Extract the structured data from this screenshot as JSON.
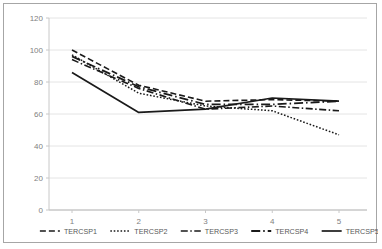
{
  "chart_data": {
    "type": "line",
    "title": "",
    "xlabel": "",
    "ylabel": "",
    "x": [
      1,
      2,
      3,
      4,
      5
    ],
    "categories": [
      "1",
      "2",
      "3",
      "4",
      "5"
    ],
    "ylim": [
      0,
      120
    ],
    "yticks": [
      0,
      20,
      40,
      60,
      80,
      100,
      120
    ],
    "ytick_labels": [
      "0",
      "20",
      "40",
      "60",
      "80",
      "100",
      "120"
    ],
    "xtick_labels": [
      "1",
      "2",
      "3",
      "4",
      "5"
    ],
    "grid": "horizontal",
    "legend_position": "bottom",
    "series": [
      {
        "name": "TERCSP1",
        "values": [
          100,
          78,
          68,
          69,
          68
        ],
        "style": "dashed",
        "color": "#1a1a1a",
        "width": 1.6,
        "dash": "6,3"
      },
      {
        "name": "TERCSP2",
        "values": [
          97,
          73,
          65,
          62,
          47
        ],
        "style": "dotted",
        "color": "#1a1a1a",
        "width": 1.5,
        "dash": "1.6,1.8"
      },
      {
        "name": "TERCSP3",
        "values": [
          94,
          76,
          63,
          65,
          62
        ],
        "style": "dash-dot",
        "color": "#1a1a1a",
        "width": 1.6,
        "dash": "7,2.5,1.5,2.5"
      },
      {
        "name": "TERCSP4",
        "values": [
          96,
          77,
          66,
          66,
          68
        ],
        "style": "long-dash-dot",
        "color": "#1a1a1a",
        "width": 1.8,
        "dash": "9,3,1.5,3"
      },
      {
        "name": "TERCSP5",
        "values": [
          86,
          61,
          63,
          70,
          68
        ],
        "style": "solid",
        "color": "#1a1a1a",
        "width": 1.7,
        "dash": "none"
      }
    ]
  },
  "colors": {
    "frame_border": "#a6a6a6",
    "gridline": "#e4e4e4",
    "axis_line": "#c8c8c8",
    "tick_label": "#7f7f7f",
    "legend_label": "#595959",
    "plot_background": "#ffffff"
  },
  "legend": {
    "items": [
      {
        "label": "TERCSP1"
      },
      {
        "label": "TERCSP2"
      },
      {
        "label": "TERCSP3"
      },
      {
        "label": "TERCSP4"
      },
      {
        "label": "TERCSP5"
      }
    ]
  }
}
